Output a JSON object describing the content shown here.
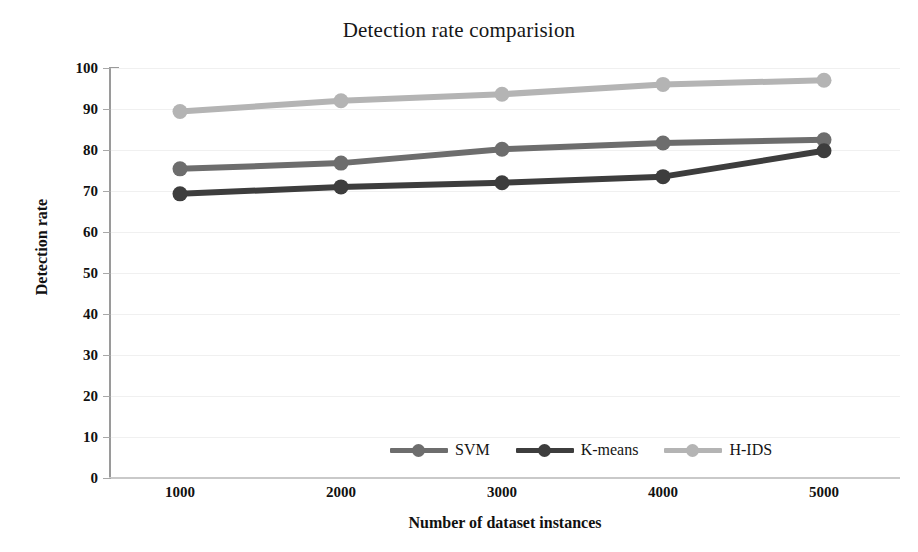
{
  "chart_data": {
    "type": "line",
    "title": "Detection rate comparision",
    "xlabel": "Number of dataset instances",
    "ylabel": "Detection rate",
    "categories": [
      "1000",
      "2000",
      "3000",
      "4000",
      "5000"
    ],
    "x": [
      1000,
      2000,
      3000,
      4000,
      5000
    ],
    "ylim": [
      0,
      100
    ],
    "y_ticks": [
      "100",
      "90",
      "80",
      "70",
      "60",
      "50",
      "40",
      "30",
      "20",
      "10",
      "0"
    ],
    "y_tick_values": [
      100,
      90,
      80,
      70,
      60,
      50,
      40,
      30,
      20,
      10,
      0
    ],
    "grid": true,
    "grid_axis": "y",
    "legend_position": "bottom",
    "series": [
      {
        "name": "SVM",
        "values": [
          75.4,
          76.8,
          80.2,
          81.7,
          82.5
        ],
        "color": "#6d6d6d"
      },
      {
        "name": "K-means",
        "values": [
          69.3,
          71.0,
          72.0,
          73.5,
          79.8
        ],
        "color": "#3d3d3d"
      },
      {
        "name": "H-IDS",
        "values": [
          89.4,
          92.0,
          93.6,
          96.0,
          97.0
        ],
        "color": "#b4b4b4"
      }
    ]
  },
  "colors": {
    "background": "#ffffff",
    "axis": "#9a9a9a",
    "grid": "#f0f0f0",
    "text": "#111111",
    "svm": "#6d6d6d",
    "kmeans": "#3d3d3d",
    "hids": "#b4b4b4"
  }
}
